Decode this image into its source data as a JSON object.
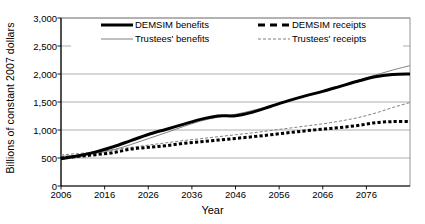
{
  "chart_data": {
    "type": "line",
    "title": "",
    "xlabel": "Year",
    "ylabel": "Billions of constant 2007 dollars",
    "xlim": [
      2006,
      2086
    ],
    "ylim": [
      0,
      3000
    ],
    "grid": true,
    "legend_position": "top-inside",
    "ytick_labels": [
      "0",
      "500",
      "1,000",
      "1,500",
      "2,000",
      "2,500",
      "3,000"
    ],
    "ytick_values": [
      0,
      500,
      1000,
      1500,
      2000,
      2500,
      3000
    ],
    "xtick_labels": [
      "2006",
      "2016",
      "2026",
      "2036",
      "2046",
      "2056",
      "2066",
      "2076"
    ],
    "xtick_values": [
      2006,
      2016,
      2026,
      2036,
      2046,
      2056,
      2066,
      2076
    ],
    "x": [
      2006,
      2010,
      2014,
      2018,
      2022,
      2026,
      2030,
      2034,
      2038,
      2042,
      2046,
      2050,
      2054,
      2058,
      2062,
      2066,
      2070,
      2074,
      2078,
      2082,
      2086
    ],
    "series": [
      {
        "name": "DEMSIM benefits",
        "style": "thick-solid",
        "color": "#000000",
        "values": [
          485,
          540,
          610,
          700,
          810,
          920,
          1010,
          1100,
          1190,
          1250,
          1255,
          1320,
          1420,
          1520,
          1610,
          1690,
          1780,
          1870,
          1950,
          1990,
          2000
        ]
      },
      {
        "name": "DEMSIM receipts",
        "style": "thick-dashed",
        "color": "#000000",
        "values": [
          500,
          530,
          560,
          595,
          660,
          690,
          720,
          760,
          790,
          820,
          850,
          880,
          915,
          950,
          985,
          1015,
          1045,
          1080,
          1130,
          1150,
          1150
        ]
      },
      {
        "name": "Trustees' benefits",
        "style": "thin-solid",
        "color": "#808080",
        "values": [
          530,
          550,
          585,
          645,
          740,
          845,
          950,
          1060,
          1160,
          1230,
          1280,
          1350,
          1430,
          1520,
          1610,
          1700,
          1790,
          1885,
          1980,
          2070,
          2150
        ]
      },
      {
        "name": "Trustees' receipts",
        "style": "thin-dashed",
        "color": "#808080",
        "values": [
          555,
          580,
          610,
          650,
          690,
          730,
          770,
          810,
          845,
          880,
          915,
          950,
          990,
          1030,
          1070,
          1110,
          1160,
          1220,
          1300,
          1400,
          1490
        ]
      }
    ]
  },
  "legend": {
    "items": [
      {
        "label": "DEMSIM benefits",
        "style": "thick-solid",
        "color": "#000000"
      },
      {
        "label": "DEMSIM receipts",
        "style": "thick-dashed",
        "color": "#000000"
      },
      {
        "label": "Trustees' benefits",
        "style": "thin-solid",
        "color": "#808080"
      },
      {
        "label": "Trustees' receipts",
        "style": "thin-dashed",
        "color": "#808080"
      }
    ]
  },
  "axes": {
    "y_title": "Billions of constant 2007 dollars",
    "x_title": "Year"
  },
  "colors": {
    "axis": "#000000",
    "grid": "#999999",
    "frame": "#888888",
    "demsim": "#000000",
    "trustees": "#808080",
    "background": "#ffffff"
  }
}
